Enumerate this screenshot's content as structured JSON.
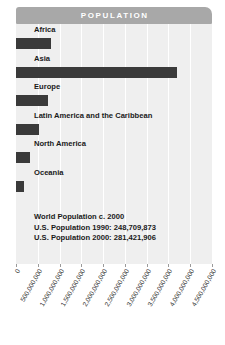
{
  "header": {
    "title": "POPULATION"
  },
  "colors": {
    "header_bar": "#a8a8a8",
    "header_text": "#ffffff",
    "panel_background": "#efefef",
    "gridline": "#ffffff",
    "bar": "#3a3a3a",
    "text": "#1a1a1a",
    "tick": "#9a9a9a",
    "page_background": "#ffffff"
  },
  "annotations": {
    "lines": [
      "World Population c. 2000",
      "U.S. Population 1990: 248,709,873",
      "U.S. Population 2000: 281,421,906"
    ]
  },
  "chart_data": {
    "type": "bar",
    "orientation": "horizontal",
    "title": "POPULATION",
    "xlabel": "",
    "ylabel": "",
    "xlim": [
      0,
      4500000000
    ],
    "grid": true,
    "legend": false,
    "categories": [
      "Africa",
      "Asia",
      "Europe",
      "Latin America and the Caribbean",
      "North America",
      "Oceania"
    ],
    "values": [
      800000000,
      3700000000,
      730000000,
      520000000,
      310000000,
      190000000
    ],
    "tick_values": [
      0,
      500000000,
      1000000000,
      1500000000,
      2000000000,
      2500000000,
      3000000000,
      3500000000,
      4000000000,
      4500000000
    ],
    "tick_labels": [
      "0",
      "500,000,000",
      "1,000,000,000",
      "1,500,000,000",
      "2,000,000,000",
      "2,500,000,000",
      "3,000,000,000",
      "3,500,000,000",
      "4,000,000,000",
      "4,500,000,000"
    ],
    "annotations": [
      "World Population c. 2000",
      "U.S. Population 1990: 248,709,873",
      "U.S. Population 2000: 281,421,906"
    ]
  }
}
